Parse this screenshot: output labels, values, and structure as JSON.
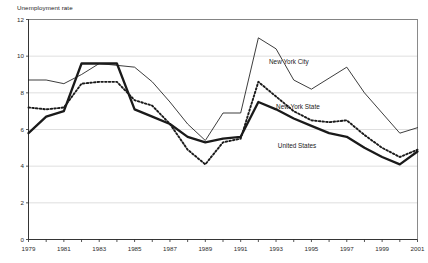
{
  "chart_data": {
    "type": "line",
    "title": "",
    "ylabel": "Unemployment rate",
    "xlabel": "",
    "ylim": [
      0,
      12
    ],
    "y_ticks": [
      0,
      2,
      4,
      6,
      8,
      10,
      12
    ],
    "xlim": [
      1979,
      2001
    ],
    "x_ticks": [
      1979,
      1981,
      1983,
      1985,
      1987,
      1989,
      1991,
      1993,
      1995,
      1997,
      1999,
      2001
    ],
    "x_tick_labels": [
      "1979",
      "1981",
      "1983",
      "1985",
      "1987",
      "1989",
      "1991",
      "1993",
      "1995",
      "1997",
      "1999",
      "2001"
    ],
    "y_tick_labels": [
      "0",
      "2",
      "4",
      "6",
      "8",
      "10",
      "12"
    ],
    "grid": true,
    "legend_position": "inline-annotations",
    "x": [
      1979,
      1980,
      1981,
      1982,
      1983,
      1984,
      1985,
      1986,
      1987,
      1988,
      1989,
      1990,
      1991,
      1992,
      1993,
      1994,
      1995,
      1996,
      1997,
      1998,
      1999,
      2000,
      2001
    ],
    "series": [
      {
        "name": "New York City",
        "style": "thin-solid",
        "values": [
          8.7,
          8.7,
          8.5,
          9.0,
          9.6,
          9.5,
          9.4,
          8.6,
          7.5,
          6.3,
          5.4,
          6.9,
          6.9,
          11.0,
          10.4,
          8.7,
          8.2,
          8.8,
          9.4,
          8.0,
          6.9,
          5.8,
          6.1
        ]
      },
      {
        "name": "New York State",
        "style": "bold-dotted",
        "values": [
          7.2,
          7.1,
          7.2,
          8.5,
          8.6,
          8.6,
          7.6,
          7.3,
          6.3,
          4.9,
          4.1,
          5.3,
          5.5,
          8.6,
          7.8,
          7.0,
          6.5,
          6.4,
          6.5,
          5.7,
          5.0,
          4.5,
          4.9
        ]
      },
      {
        "name": "United States",
        "style": "bold-solid",
        "values": [
          5.8,
          6.7,
          7.0,
          9.6,
          9.6,
          9.6,
          7.1,
          6.7,
          6.3,
          5.6,
          5.3,
          5.5,
          5.6,
          7.5,
          7.1,
          6.6,
          6.2,
          5.8,
          5.6,
          5.0,
          4.5,
          4.1,
          4.8
        ]
      }
    ]
  },
  "annotations": [
    {
      "text": "New York City",
      "x": 1992.6,
      "y": 9.6
    },
    {
      "text": "New York State",
      "x": 1993.0,
      "y": 7.1
    },
    {
      "text": "United States",
      "x": 1993.1,
      "y": 5.0
    }
  ]
}
